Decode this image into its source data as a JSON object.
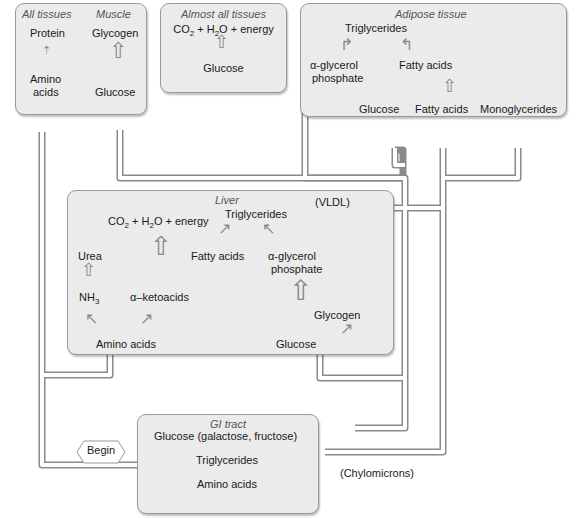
{
  "colors": {
    "box_fill": "#ebebeb",
    "box_border": "#9a9a9a",
    "pipe": "#ffffff",
    "pipe_border": "#8a8a8a"
  },
  "all_tissues": {
    "title": "All tissues",
    "top": "Protein",
    "bottom_line1": "Amino",
    "bottom_line2": "acids"
  },
  "muscle": {
    "title": "Muscle",
    "top": "Glycogen",
    "bottom": "Glucose"
  },
  "almost_all": {
    "title": "Almost all tissues",
    "co2": "CO",
    "co2_sub": "2",
    "plus_h": " + H",
    "h2_sub": "2",
    "rest": "O + energy",
    "bottom": "Glucose"
  },
  "adipose": {
    "title": "Adipose tissue",
    "triglycerides": "Triglycerides",
    "agp_line1": "α-glycerol",
    "agp_line2": "phosphate",
    "fatty_acids_mid": "Fatty acids",
    "glucose": "Glucose",
    "fatty_acids": "Fatty acids",
    "monoglycerides": "Monoglycerides"
  },
  "liver": {
    "title": "Liver",
    "vldl": "(VLDL)",
    "triglycerides": "Triglycerides",
    "co2": "CO",
    "co2_sub": "2",
    "plus_h": " + H",
    "h2_sub": "2",
    "rest": "O + energy",
    "urea": "Urea",
    "nh": "NH",
    "nh_sub": "3",
    "ketoacids": "α–ketoacids",
    "fatty_acids": "Fatty acids",
    "agp_line1": "α-glycerol",
    "agp_line2": "phosphate",
    "glycogen": "Glycogen",
    "amino_acids": "Amino acids",
    "glucose": "Glucose"
  },
  "gi_tract": {
    "title": "GI tract",
    "glucose": "Glucose (galactose, fructose)",
    "triglycerides": "Triglycerides",
    "amino_acids": "Amino acids"
  },
  "chylomicrons": "(Chylomicrons)",
  "begin": "Begin"
}
